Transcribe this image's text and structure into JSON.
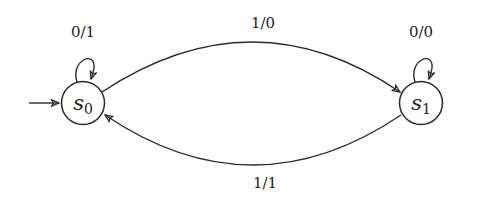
{
  "diagram": {
    "type": "finite-state-machine (Mealy)",
    "states": [
      {
        "id": "s0",
        "label": "s",
        "subscript": "0",
        "initial": true
      },
      {
        "id": "s1",
        "label": "s",
        "subscript": "1",
        "initial": false
      }
    ],
    "transitions": [
      {
        "from": "s0",
        "to": "s0",
        "label": "0/1"
      },
      {
        "from": "s0",
        "to": "s1",
        "label": "1/0"
      },
      {
        "from": "s1",
        "to": "s1",
        "label": "0/0"
      },
      {
        "from": "s1",
        "to": "s0",
        "label": "1/1"
      }
    ],
    "colors": {
      "stroke": "#2a2a2a",
      "background": "#ffffff"
    }
  }
}
